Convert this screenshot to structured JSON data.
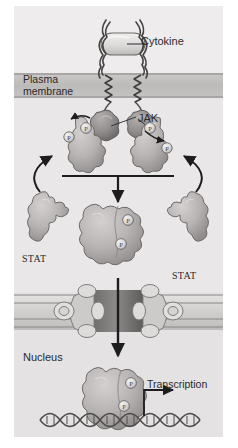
{
  "figure": {
    "background_color": "#eceaea",
    "labels": {
      "cytokine": "Cytokine",
      "plasma_membrane": "Plasma\nmembrane",
      "jak": "JAK",
      "stat_left": "STAT",
      "stat_right": "STAT",
      "nucleus": "Nucleus",
      "transcription": "Transcription"
    }
  },
  "compartments": [
    {
      "name": "extracellular-space",
      "label": "",
      "fill": "#eeecec"
    },
    {
      "name": "plasma-membrane",
      "label": "Plasma membrane",
      "fill": "#c5c2c2"
    },
    {
      "name": "cytosol",
      "label": "",
      "fill": "#e9e7e7"
    },
    {
      "name": "nucleus",
      "label": "Nucleus",
      "fill": "#e4e2e2"
    }
  ],
  "molecules": {
    "cytokine": {
      "label": "Cytokine",
      "shape": "capsule",
      "fill": "#dedbdb"
    },
    "receptor": {
      "label": "",
      "count": 2,
      "shape": "zigzag-transmembrane-chain",
      "stroke": "#4a4747"
    },
    "jak": {
      "label": "JAK",
      "count": 2,
      "shape": "blob",
      "fill": "#8f8c8c"
    },
    "stat": {
      "label": "STAT",
      "count": 2,
      "shape": "blob",
      "fill": "#b6b2b2"
    },
    "phosphate": {
      "label": "P",
      "count": 6,
      "shape": "circle",
      "fill": "#dcd9d9"
    },
    "stat_dimer": {
      "label": "",
      "count": 2,
      "shape": "paired-blob",
      "fill": "#aeaaaa"
    },
    "nuclear_pore": {
      "label": "",
      "count": 1,
      "shape": "pore-complex",
      "fill": "#c8c5c5"
    },
    "dna": {
      "label": "",
      "shape": "double-helix",
      "stroke": "#55524f"
    }
  },
  "arrows": [
    {
      "name": "stat-recruit-left",
      "style": "curved",
      "direction": "up-right"
    },
    {
      "name": "stat-recruit-right",
      "style": "curved",
      "direction": "up-left"
    },
    {
      "name": "phospho-release-left",
      "style": "curved",
      "direction": "left"
    },
    {
      "name": "phospho-release-right",
      "style": "curved",
      "direction": "right"
    },
    {
      "name": "dimerization-junction",
      "style": "t-junction",
      "direction": "down"
    },
    {
      "name": "nuclear-import",
      "style": "straight",
      "direction": "down"
    },
    {
      "name": "transcription-arrow",
      "style": "elbow",
      "direction": "right",
      "label": "Transcription"
    }
  ],
  "colors": {
    "page_background": "#ffffff",
    "figure_background": "#eceaea",
    "membrane": "#c5c2c2",
    "membrane_line": "#a8a5a5",
    "nucleus_background": "#e4e2e2",
    "protein_light": "#b6b2b2",
    "protein_dark": "#8f8c8c",
    "ink": "#2b2b2b"
  }
}
